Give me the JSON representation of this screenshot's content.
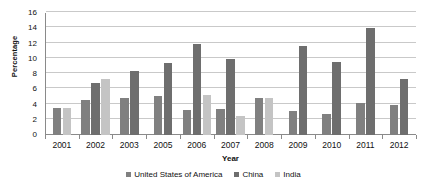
{
  "chart_data": {
    "type": "bar",
    "title": "",
    "xlabel": "Year",
    "ylabel": "Percentage",
    "categories": [
      "2001",
      "2002",
      "2003",
      "2005",
      "2006",
      "2007",
      "2008",
      "2009",
      "2010",
      "2011",
      "2012"
    ],
    "series": [
      {
        "name": "United States of America",
        "color": "#808080",
        "values": [
          3.55,
          4.6,
          4.85,
          5.15,
          3.3,
          3.4,
          4.9,
          3.2,
          2.7,
          4.2,
          4.0
        ]
      },
      {
        "name": "China",
        "color": "#6e6e6e",
        "values": [
          null,
          6.8,
          8.35,
          9.4,
          12.0,
          10.0,
          null,
          11.7,
          9.6,
          14.1,
          7.3
        ]
      },
      {
        "name": "India",
        "color": "#c4c4c4",
        "values": [
          3.55,
          7.4,
          null,
          null,
          5.2,
          2.5,
          4.8,
          null,
          null,
          null,
          null
        ]
      }
    ],
    "ylim": [
      0,
      16
    ],
    "yticks": [
      0,
      2,
      4,
      6,
      8,
      10,
      12,
      14,
      16
    ],
    "grid": "horizontal",
    "legend_position": "bottom"
  },
  "axes": {
    "y_title": "Percentage",
    "x_title": "Year"
  },
  "legend": {
    "items": [
      {
        "label": "United States of America",
        "color": "#808080"
      },
      {
        "label": "China",
        "color": "#6e6e6e"
      },
      {
        "label": "India",
        "color": "#c4c4c4"
      }
    ]
  }
}
